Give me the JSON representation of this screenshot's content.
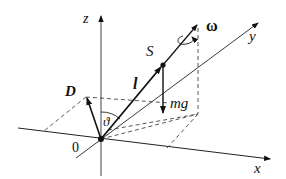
{
  "diagram": {
    "labels": {
      "z_axis": "z",
      "x_axis": "x",
      "y_axis": "y",
      "origin": "0",
      "omega": "ω",
      "center_of_mass": "S",
      "length": "l",
      "weight": "mg",
      "angular_momentum": "D",
      "angle": "ϑ"
    },
    "colors": {
      "line": "#111111",
      "axis": "#333333",
      "dashed": "#444444",
      "background": "#ffffff"
    }
  }
}
